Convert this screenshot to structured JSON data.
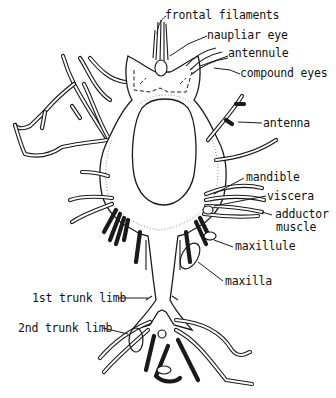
{
  "figure": {
    "labels": [
      {
        "id": "frontal-filaments",
        "text": "frontal filaments"
      },
      {
        "id": "naupliar-eye",
        "text": "naupliar eye"
      },
      {
        "id": "antennule",
        "text": "antennule"
      },
      {
        "id": "compound-eyes",
        "text": "compound eyes"
      },
      {
        "id": "antenna",
        "text": "antenna"
      },
      {
        "id": "mandible",
        "text": "mandible"
      },
      {
        "id": "viscera",
        "text": "viscera"
      },
      {
        "id": "adductor-muscle-line1",
        "text": "adductor"
      },
      {
        "id": "adductor-muscle-line2",
        "text": "muscle"
      },
      {
        "id": "maxillule",
        "text": "maxillule"
      },
      {
        "id": "maxilla",
        "text": "maxilla"
      },
      {
        "id": "first-trunk-limb",
        "text": "1st trunk limb"
      },
      {
        "id": "second-trunk-limb",
        "text": "2nd trunk limb"
      }
    ]
  }
}
